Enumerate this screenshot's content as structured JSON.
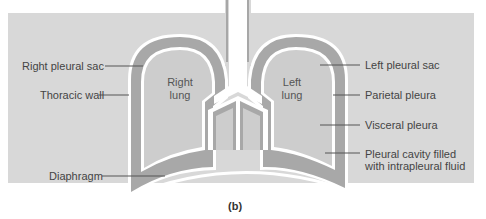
{
  "figure": {
    "caption": "(b)",
    "colors": {
      "background": "#d8d8d8",
      "pleural_cavity": "#a8a8a8",
      "lung": "#cdcdcd",
      "membrane": "#ffffff",
      "leader": "#555555"
    }
  },
  "organs": {
    "right_lung_line1": "Right",
    "right_lung_line2": "lung",
    "left_lung_line1": "Left",
    "left_lung_line2": "lung"
  },
  "labels": {
    "left_side": [
      {
        "text": "Right pleural sac"
      },
      {
        "text": "Thoracic wall"
      },
      {
        "text": "Diaphragm"
      }
    ],
    "right_side": [
      {
        "text": "Left pleural sac"
      },
      {
        "text": "Parietal pleura"
      },
      {
        "text": "Visceral pleura"
      },
      {
        "line1": "Pleural cavity filled",
        "line2": "with intrapleural fluid"
      }
    ]
  }
}
